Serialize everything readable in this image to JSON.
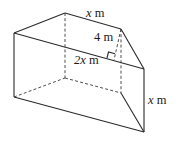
{
  "figure": {
    "labels": {
      "top_edge": {
        "var": "x",
        "unit": " m"
      },
      "height": {
        "var": "4",
        "unit": " m"
      },
      "base": {
        "var": "2x",
        "unit": " m"
      },
      "side": {
        "var": "x",
        "unit": " m"
      }
    },
    "colors": {
      "line": "#2a2a2a",
      "background": "#ffffff"
    }
  }
}
